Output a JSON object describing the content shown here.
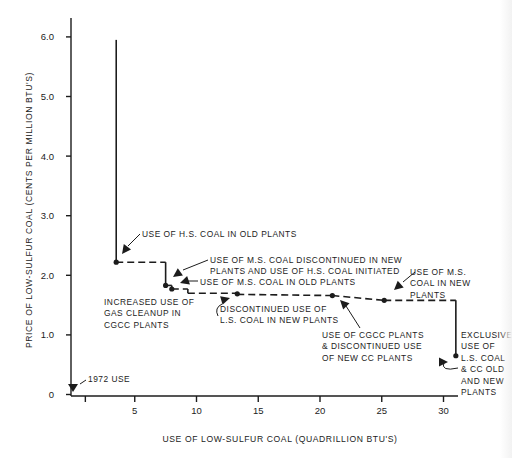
{
  "chart_data": {
    "type": "line",
    "title": "",
    "xlabel": "USE OF LOW-SULFUR COAL (QUADRILLION BTU'S)",
    "ylabel": "PRICE OF LOW-SULFUR COAL (CENTS PER MILLION BTU'S)",
    "xlim": [
      0,
      32
    ],
    "ylim": [
      0,
      6.3
    ],
    "x_ticks": [
      1,
      5,
      10,
      15,
      20,
      25,
      30
    ],
    "x_tick_labels": [
      "",
      "5",
      "10",
      "15",
      "20",
      "25",
      "30"
    ],
    "y_ticks": [
      0,
      1.0,
      2.0,
      3.0,
      4.0,
      5.0,
      6.0
    ],
    "y_tick_labels": [
      "0",
      "1.0",
      "2.0",
      "3.0",
      "4.0",
      "5.0",
      "6.0"
    ],
    "grid": false,
    "legend": "none",
    "series": [
      {
        "name": "supply step curve",
        "style": "step",
        "segments": [
          {
            "from": [
              3.5,
              5.95
            ],
            "to": [
              3.5,
              2.22
            ],
            "dash": false
          },
          {
            "from": [
              3.5,
              2.22
            ],
            "to": [
              7.5,
              2.22
            ],
            "dash": true
          },
          {
            "from": [
              7.5,
              2.22
            ],
            "to": [
              7.5,
              1.83
            ],
            "dash": false
          },
          {
            "from": [
              7.5,
              1.83
            ],
            "to": [
              8.0,
              1.83
            ],
            "dash": true
          },
          {
            "from": [
              8.0,
              1.83
            ],
            "to": [
              8.0,
              1.77
            ],
            "dash": false
          },
          {
            "from": [
              8.0,
              1.77
            ],
            "to": [
              9.3,
              1.77
            ],
            "dash": true
          },
          {
            "from": [
              9.3,
              1.77
            ],
            "to": [
              9.3,
              1.7
            ],
            "dash": false
          },
          {
            "from": [
              9.3,
              1.7
            ],
            "to": [
              13.3,
              1.7
            ],
            "dash": true
          },
          {
            "from": [
              13.3,
              1.68
            ],
            "to": [
              21.0,
              1.66
            ],
            "dash": true
          },
          {
            "from": [
              21.0,
              1.66
            ],
            "to": [
              25.2,
              1.58
            ],
            "dash": true
          },
          {
            "from": [
              25.2,
              1.58
            ],
            "to": [
              31.0,
              1.58
            ],
            "dash": true
          },
          {
            "from": [
              31.0,
              1.58
            ],
            "to": [
              31.0,
              0.65
            ],
            "dash": false
          }
        ],
        "points": [
          {
            "x": 3.5,
            "y": 2.22
          },
          {
            "x": 7.5,
            "y": 1.83
          },
          {
            "x": 8.0,
            "y": 1.77
          },
          {
            "x": 13.3,
            "y": 1.69
          },
          {
            "x": 21.0,
            "y": 1.66
          },
          {
            "x": 25.2,
            "y": 1.58
          },
          {
            "x": 31.0,
            "y": 0.65
          }
        ]
      }
    ],
    "annotations": [
      {
        "id": "1972-use",
        "lines": [
          "1972 USE"
        ],
        "target": [
          0.8,
          0.12
        ]
      },
      {
        "id": "hs-coal-old",
        "lines": [
          "USE OF H.S. COAL IN OLD PLANTS"
        ],
        "target": [
          3.6,
          2.3
        ]
      },
      {
        "id": "ms-discontinued",
        "lines": [
          "USE OF M.S. COAL DISCONTINUED IN NEW",
          "PLANTS AND USE OF H.S. COAL INITIATED"
        ],
        "target": [
          7.6,
          1.9
        ]
      },
      {
        "id": "ms-coal-old",
        "lines": [
          "USE OF M.S. COAL IN OLD PLANTS"
        ],
        "target": [
          8.5,
          1.85
        ]
      },
      {
        "id": "gas-cleanup",
        "lines": [
          "INCREASED USE OF",
          "GAS CLEANUP IN",
          "CGCC PLANTS"
        ],
        "target": null
      },
      {
        "id": "ls-discontinued",
        "lines": [
          "DISCONTINUED USE OF",
          "L.S. COAL IN NEW PLANTS"
        ],
        "target": [
          13.2,
          1.62
        ]
      },
      {
        "id": "cgcc-plants",
        "lines": [
          "USE OF CGCC PLANTS",
          "& DISCONTINUED USE",
          "OF NEW CC PLANTS"
        ],
        "target": [
          21.1,
          1.6
        ]
      },
      {
        "id": "ms-coal-new",
        "lines": [
          "USE OF M.S.",
          "COAL IN NEW",
          "PLANTS"
        ],
        "target": [
          25.3,
          1.63
        ]
      },
      {
        "id": "exclusive-use",
        "lines": [
          "EXCLUSIVE",
          "USE OF",
          "L.S. COAL",
          "& CC OLD",
          "AND NEW",
          "PLANTS"
        ],
        "target": [
          30.8,
          0.7
        ]
      }
    ]
  }
}
